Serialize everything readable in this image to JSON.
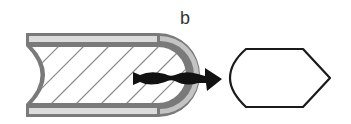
{
  "figure": {
    "panel_label": "b",
    "elements": [
      {
        "name": "cylindrical-body",
        "description": "Rounded capsule tube with hatched interior and concave left end"
      },
      {
        "name": "insertion-arrow",
        "description": "Twisted black arrow pointing right through the rounded end"
      },
      {
        "name": "lens-shape",
        "description": "Outlined hexagonal/lens shape to the right"
      }
    ],
    "colors": {
      "wall": "#7a7a7a",
      "inner_strip": "#dcdcdc",
      "hatch": "#8a8a8a",
      "arrow": "#111111",
      "outline": "#1a1a1a"
    }
  }
}
